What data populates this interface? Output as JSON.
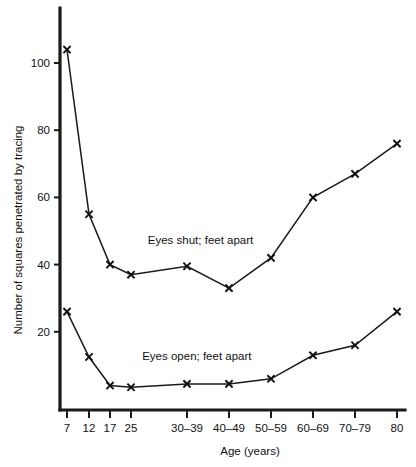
{
  "chart_data": {
    "type": "line",
    "title": "",
    "xlabel": "Age (years)",
    "ylabel": "Number of squares penetrated by tracing",
    "x_categories": [
      "7",
      "12",
      "17",
      "25",
      "30–39",
      "40–49",
      "50–59",
      "60–69",
      "70–79",
      "80"
    ],
    "ytick_labels": [
      "20",
      "40",
      "60",
      "80",
      "100"
    ],
    "ytick_values": [
      20,
      40,
      60,
      80,
      100
    ],
    "ylim": [
      0,
      112
    ],
    "xlim": [
      0,
      9
    ],
    "grid": false,
    "legend_position": "inline-annotation",
    "series": [
      {
        "name": "Eyes shut; feet apart",
        "label": "Eyes shut; feet apart",
        "marker": "x",
        "values": [
          104,
          55,
          40,
          37,
          39.5,
          33,
          42,
          60,
          67,
          76
        ]
      },
      {
        "name": "Eyes open; feet apart",
        "label": "Eyes open; feet apart",
        "marker": "x",
        "values": [
          26,
          12.5,
          4,
          3.5,
          4.5,
          4.5,
          6,
          13,
          16,
          26
        ]
      }
    ],
    "annotations": [
      {
        "text": "Eyes shut; feet apart",
        "x_index": 3.3,
        "y_value": 46
      },
      {
        "text": "Eyes open; feet apart",
        "x_index": 3.2,
        "y_value": 11.5
      }
    ],
    "colors": {
      "line": "#1a1a1a",
      "axis": "#1a1a1a",
      "text": "#111111",
      "background": "#ffffff"
    }
  }
}
